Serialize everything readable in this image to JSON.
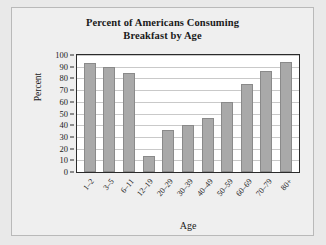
{
  "chart_data": {
    "type": "bar",
    "title": "Percent of Americans Consuming Breakfast by Age",
    "title_line1": "Percent of Americans Consuming",
    "title_line2": "Breakfast by Age",
    "xlabel": "Age",
    "ylabel": "Percent",
    "ylim": [
      0,
      100
    ],
    "ytick_step": 10,
    "yticks": [
      0,
      10,
      20,
      30,
      40,
      50,
      60,
      70,
      80,
      90,
      100
    ],
    "ytick_labels": [
      "0",
      "10",
      "20",
      "30",
      "40",
      "50",
      "60",
      "70",
      "80",
      "90",
      "100"
    ],
    "grid": true,
    "grid_axis": "y",
    "legend": false,
    "categories": [
      "1–2",
      "3–5",
      "6–11",
      "12–19",
      "20–29",
      "30–39",
      "40–49",
      "50–59",
      "60–69",
      "70–79",
      "80+"
    ],
    "values": [
      93,
      90,
      85,
      14,
      36,
      40.5,
      46,
      60,
      75,
      86,
      94
    ],
    "bar_color": "#a9a9a9",
    "bar_edge_color": "#8a8a8a",
    "plot_background": "#ffffff",
    "page_background": "#e9e9e9",
    "axis_color": "#2b2b2b",
    "grid_color": "#c9c9c9"
  }
}
